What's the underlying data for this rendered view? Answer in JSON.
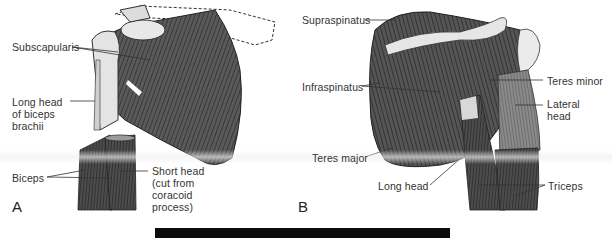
{
  "figure": {
    "panels": [
      {
        "letter": "A",
        "view": "anterior shoulder",
        "labels": {
          "subscapularis": "Subscapularis",
          "long_head_biceps": "Long head\nof biceps\nbrachii",
          "biceps": "Biceps",
          "short_head": "Short head\n(cut from\ncoracoid\nprocess)"
        }
      },
      {
        "letter": "B",
        "view": "posterior shoulder",
        "labels": {
          "supraspinatus": "Supraspinatus",
          "infraspinatus": "Infraspinatus",
          "teres_minor": "Teres minor",
          "lateral_head": "Lateral\nhead",
          "teres_major": "Teres major",
          "long_head": "Long head",
          "triceps": "Triceps"
        }
      }
    ]
  },
  "colors": {
    "muscle_dark": "#3a3a3a",
    "muscle_mid": "#6b6b6b",
    "bone_light": "#e6e6e6",
    "leader_line": "#333333",
    "bar": "#0c0c0c"
  }
}
